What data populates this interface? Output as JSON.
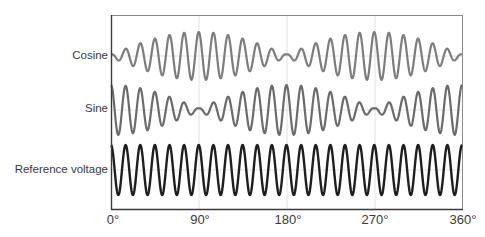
{
  "chart_data": {
    "type": "line",
    "title": "",
    "xlabel": "",
    "ylabel": "",
    "x_ticks": [
      "0°",
      "90°",
      "180°",
      "270°",
      "360°"
    ],
    "x_range_deg": [
      0,
      360
    ],
    "grid": true,
    "carrier_cycles": 24,
    "series": [
      {
        "name": "Cosine",
        "color": "#7a7a7a",
        "description": "Carrier amplitude-modulated by |sin(θ)|: near zero at 0°, 180°, 360°; maximum near 90° and 270°",
        "envelope": "abs_sin",
        "envelope_samples": {
          "0": 0.05,
          "45": 0.7,
          "90": 1.0,
          "135": 0.7,
          "180": 0.05,
          "225": 0.7,
          "270": 1.0,
          "315": 0.7,
          "360": 0.05
        }
      },
      {
        "name": "Sine",
        "color": "#6a6a6a",
        "description": "Carrier amplitude-modulated by |cos(θ)|: maximum at 0°, 180°, 360°; near zero at 90° and 270°",
        "envelope": "abs_cos",
        "envelope_samples": {
          "0": 1.0,
          "45": 0.7,
          "90": 0.05,
          "135": 0.7,
          "180": 1.0,
          "225": 0.7,
          "270": 0.05,
          "315": 0.7,
          "360": 1.0
        }
      },
      {
        "name": "Reference voltage",
        "color": "#222222",
        "description": "Constant-amplitude carrier sine wave",
        "envelope": "constant",
        "envelope_samples": {
          "0": 1.0,
          "90": 1.0,
          "180": 1.0,
          "270": 1.0,
          "360": 1.0
        }
      }
    ]
  },
  "labels": {
    "cosine": "Cosine",
    "sine": "Sine",
    "reference": "Reference voltage"
  },
  "ticks": {
    "t0": "0°",
    "t90": "90°",
    "t180": "180°",
    "t270": "270°",
    "t360": "360°"
  }
}
